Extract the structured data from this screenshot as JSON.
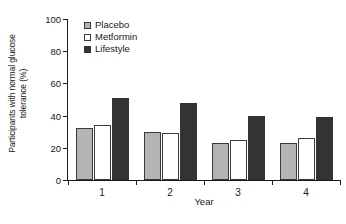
{
  "chart_data": {
    "type": "bar",
    "title": "",
    "xlabel": "Year",
    "ylabel_line1": "Participants with normal glucose",
    "ylabel_line2": "tolerance (%)",
    "ylabel": "Participants with normal glucose tolerance (%)",
    "categories": [
      "1",
      "2",
      "3",
      "4"
    ],
    "ylim": [
      0,
      100
    ],
    "yticks": [
      0,
      20,
      40,
      60,
      80,
      100
    ],
    "ytick_labels": [
      "0",
      "20",
      "40",
      "60",
      "80",
      "100"
    ],
    "grid": false,
    "legend_position": "top-left-inside",
    "series": [
      {
        "name": "Placebo",
        "color": "#b4b4b4",
        "values": [
          32,
          30,
          23,
          23
        ]
      },
      {
        "name": "Metformin",
        "color": "#ffffff",
        "values": [
          34,
          29.5,
          25,
          26
        ]
      },
      {
        "name": "Lifestyle",
        "color": "#333333",
        "values": [
          51,
          48,
          40,
          39
        ]
      }
    ]
  },
  "legend": {
    "items": [
      {
        "label": "Placebo"
      },
      {
        "label": "Metformin"
      },
      {
        "label": "Lifestyle"
      }
    ]
  }
}
